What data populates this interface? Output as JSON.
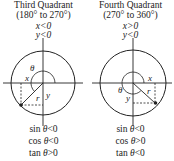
{
  "panels": [
    {
      "title": "Third Quadrant",
      "range": "(180° to 270°)",
      "conditions": [
        "x<0",
        "y<0"
      ],
      "labels": {
        "theta": "θ",
        "x": "x",
        "y": "y",
        "r": "r"
      },
      "signs": [
        {
          "fn": "sin",
          "var": "θ",
          "rel": "<0"
        },
        {
          "fn": "cos",
          "var": "θ",
          "rel": "<0"
        },
        {
          "fn": "tan",
          "var": "θ",
          "rel": ">0"
        }
      ]
    },
    {
      "title": "Fourth Quadrant",
      "range": "(270° to 360°)",
      "conditions": [
        "x>0",
        "y<0"
      ],
      "labels": {
        "theta": "θ",
        "x": "x",
        "y": "y",
        "r": "r"
      },
      "signs": [
        {
          "fn": "sin",
          "var": "θ",
          "rel": "<0"
        },
        {
          "fn": "cos",
          "var": "θ",
          "rel": ">0"
        },
        {
          "fn": "tan",
          "var": "θ",
          "rel": "<0"
        }
      ]
    }
  ],
  "colors": {
    "line": "#222222",
    "background": "#ffffff"
  }
}
